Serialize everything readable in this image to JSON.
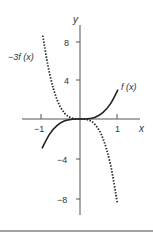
{
  "chart_data": {
    "type": "line",
    "title": "",
    "xlabel": "x",
    "ylabel": "y",
    "xlim": [
      -1.1,
      1.3
    ],
    "ylim": [
      -10,
      10
    ],
    "grid": false,
    "x_ticks": [
      {
        "value": -1,
        "label": "−1"
      },
      {
        "value": 1,
        "label": "1"
      }
    ],
    "y_ticks": [
      {
        "value": 8,
        "label": "8"
      },
      {
        "value": 4,
        "label": "4"
      },
      {
        "value": -4,
        "label": "−4"
      },
      {
        "value": -8,
        "label": "−8"
      }
    ],
    "series": [
      {
        "name": "f(x)",
        "label": "f (x)",
        "style": "solid",
        "color": "#222222",
        "x": [
          -1,
          -0.8,
          -0.6,
          -0.4,
          -0.2,
          0,
          0.2,
          0.4,
          0.6,
          0.8,
          1
        ],
        "y": [
          -3,
          -1.54,
          -0.65,
          -0.19,
          -0.02,
          0,
          0.02,
          0.19,
          0.65,
          1.54,
          3
        ]
      },
      {
        "name": "-3f(x)",
        "label": "−3f (x)",
        "style": "dotted",
        "color": "#222222",
        "x": [
          -0.98,
          -0.8,
          -0.6,
          -0.4,
          -0.2,
          0,
          0.2,
          0.4,
          0.6,
          0.8,
          0.98
        ],
        "y": [
          8.5,
          4.61,
          1.94,
          0.58,
          0.07,
          0,
          -0.07,
          -0.58,
          -1.94,
          -4.61,
          -8.5
        ]
      }
    ],
    "annotations": [
      {
        "text": "f (x)",
        "near": "end of solid curve, upper right"
      },
      {
        "text": "−3f (x)",
        "near": "start of dotted curve, upper left"
      }
    ],
    "legend_position": "none (inline labels)"
  },
  "labels": {
    "x_axis": "x",
    "y_axis": "y",
    "f_label": "f (x)",
    "neg3f_label": "−3f (x)",
    "tick_x_neg1": "−1",
    "tick_x_1": "1",
    "tick_y_8": "8",
    "tick_y_4": "4",
    "tick_y_neg4": "−4",
    "tick_y_neg8": "−8"
  }
}
